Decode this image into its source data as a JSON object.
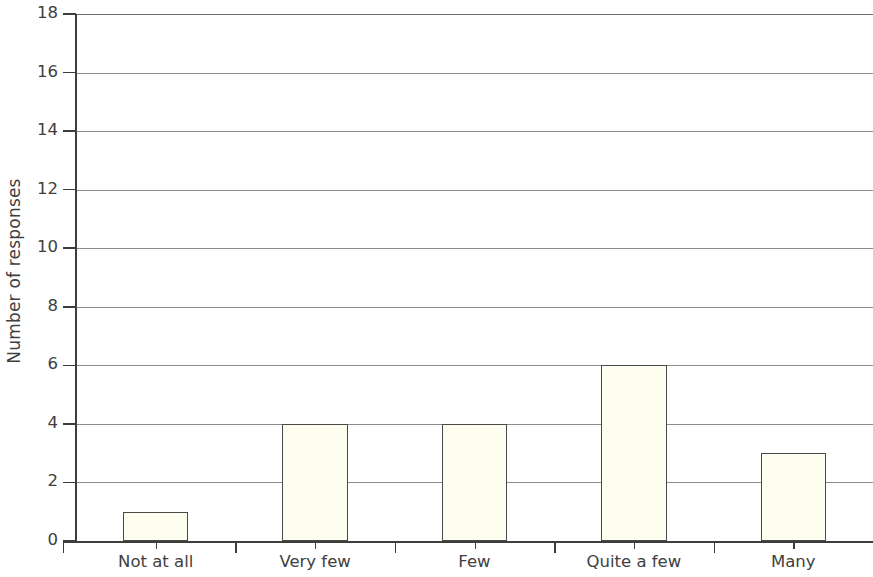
{
  "chart_data": {
    "type": "bar",
    "title": "",
    "subtitle": "",
    "xlabel": "",
    "ylabel": "Number of responses",
    "categories": [
      "Not at all",
      "Very few",
      "Few",
      "Quite a few",
      "Many"
    ],
    "values": [
      1,
      4,
      4,
      6,
      3
    ],
    "ylim": [
      0,
      18
    ],
    "ytick_step": 2,
    "yticks": [
      0,
      2,
      4,
      6,
      8,
      10,
      12,
      14,
      16,
      18
    ],
    "ytick_labels": [
      "0",
      "2",
      "4",
      "6",
      "8",
      "10",
      "12",
      "14",
      "16",
      "18"
    ],
    "grid": true,
    "grid_axis": "y",
    "legend": false,
    "legend_position": "none",
    "bar_fill_color": "#fdfdf0",
    "bar_edge_color": "#4a4a4a",
    "grid_color": "#8d8d8d",
    "axis_color": "#3d3d3d",
    "text_color": "#404040",
    "background_color": "#ffffff"
  }
}
